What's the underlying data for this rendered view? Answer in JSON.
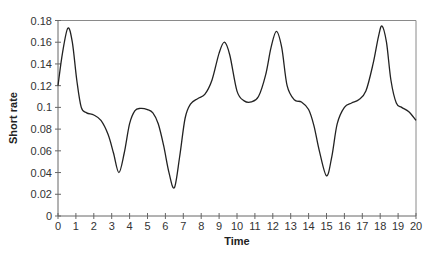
{
  "chart_data": {
    "type": "line",
    "title": "",
    "xlabel": "Time",
    "ylabel": "Short rate",
    "xlim": [
      0,
      20
    ],
    "ylim": [
      0,
      0.18
    ],
    "grid": false,
    "legend": null,
    "x_ticks": [
      "0",
      "1",
      "2",
      "3",
      "4",
      "5",
      "6",
      "7",
      "8",
      "9",
      "10",
      "11",
      "12",
      "13",
      "14",
      "15",
      "16",
      "17",
      "18",
      "19",
      "20"
    ],
    "y_ticks": [
      "0",
      "0.02",
      "0.04",
      "0.06",
      "0.08",
      "0.1",
      "0.12",
      "0.14",
      "0.16",
      "0.18"
    ],
    "series": [
      {
        "name": "Short rate",
        "color": "#222222",
        "x": [
          0,
          0.25,
          0.55,
          0.8,
          1.05,
          1.3,
          1.6,
          2.0,
          2.4,
          2.8,
          3.1,
          3.4,
          3.7,
          4.0,
          4.3,
          4.6,
          5.0,
          5.3,
          5.6,
          5.9,
          6.2,
          6.5,
          6.8,
          7.1,
          7.4,
          7.8,
          8.2,
          8.6,
          9.0,
          9.3,
          9.6,
          10.0,
          10.4,
          10.8,
          11.2,
          11.6,
          11.9,
          12.2,
          12.5,
          12.8,
          13.2,
          13.6,
          14.0,
          14.3,
          14.6,
          15.0,
          15.3,
          15.6,
          16.0,
          16.4,
          16.8,
          17.2,
          17.6,
          17.9,
          18.1,
          18.35,
          18.6,
          18.9,
          19.2,
          19.6,
          20.0
        ],
        "values": [
          0.12,
          0.15,
          0.173,
          0.16,
          0.125,
          0.1,
          0.095,
          0.093,
          0.088,
          0.075,
          0.058,
          0.04,
          0.058,
          0.085,
          0.097,
          0.099,
          0.098,
          0.095,
          0.085,
          0.065,
          0.04,
          0.026,
          0.055,
          0.09,
          0.103,
          0.108,
          0.112,
          0.125,
          0.15,
          0.16,
          0.148,
          0.115,
          0.106,
          0.105,
          0.11,
          0.13,
          0.155,
          0.17,
          0.155,
          0.12,
          0.107,
          0.105,
          0.098,
          0.083,
          0.06,
          0.037,
          0.055,
          0.085,
          0.1,
          0.104,
          0.107,
          0.115,
          0.14,
          0.165,
          0.175,
          0.16,
          0.125,
          0.104,
          0.1,
          0.096,
          0.088
        ]
      }
    ]
  }
}
